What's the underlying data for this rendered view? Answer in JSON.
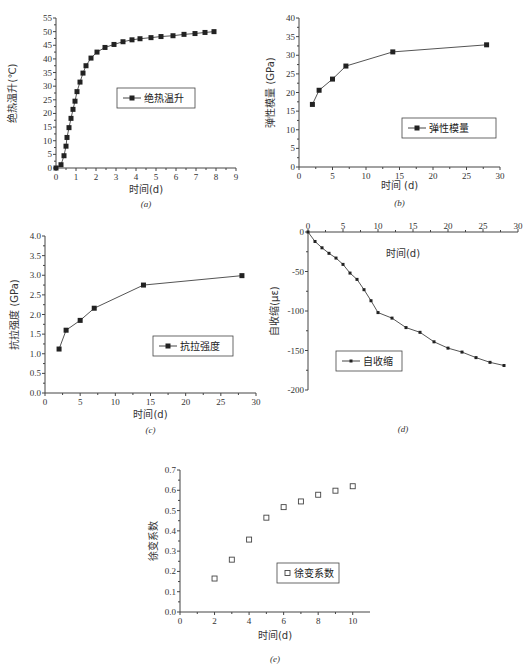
{
  "chart_data": [
    {
      "id": "a",
      "type": "line",
      "caption": "(a)",
      "xlabel": "时间(d)",
      "ylabel": "绝热温升(℃)",
      "xlim": [
        0,
        9
      ],
      "ylim": [
        0,
        55
      ],
      "xticks": [
        0,
        1,
        2,
        3,
        4,
        5,
        6,
        7,
        8,
        9
      ],
      "yticks": [
        0,
        5,
        10,
        15,
        20,
        25,
        30,
        35,
        40,
        45,
        50,
        55
      ],
      "legend": "绝热温升",
      "marker": "filled-square",
      "x": [
        0,
        0.25,
        0.4,
        0.5,
        0.55,
        0.65,
        0.75,
        0.85,
        0.95,
        1.05,
        1.2,
        1.35,
        1.5,
        1.75,
        2.05,
        2.45,
        2.9,
        3.35,
        3.8,
        4.2,
        4.75,
        5.25,
        5.85,
        6.4,
        6.95,
        7.45,
        7.9
      ],
      "values": [
        0,
        1.2,
        4.5,
        8,
        11.2,
        14.8,
        18.2,
        21.5,
        24.5,
        28,
        31.5,
        34.8,
        37.5,
        40.3,
        42.5,
        44.2,
        45.3,
        46.3,
        47,
        47.4,
        47.8,
        48.2,
        48.5,
        49,
        49.3,
        49.7,
        50
      ]
    },
    {
      "id": "b",
      "type": "line",
      "caption": "(b)",
      "xlabel": "时间 (d)",
      "ylabel": "弹性模量 (GPa)",
      "xlim": [
        0,
        30
      ],
      "ylim": [
        0,
        40
      ],
      "xticks": [
        0,
        5,
        10,
        15,
        20,
        25,
        30
      ],
      "yticks": [
        0,
        5,
        10,
        15,
        20,
        25,
        30,
        35,
        40
      ],
      "legend": "弹性模量",
      "marker": "filled-square",
      "x": [
        2,
        3,
        5,
        7,
        14,
        28
      ],
      "values": [
        16.8,
        20.6,
        23.6,
        27.1,
        30.9,
        32.8
      ]
    },
    {
      "id": "c",
      "type": "line",
      "caption": "(c)",
      "xlabel": "时间(d)",
      "ylabel": "抗拉强度 (GPa)",
      "xlim": [
        0,
        30
      ],
      "ylim": [
        0,
        4.0
      ],
      "xticks": [
        0,
        5,
        10,
        15,
        20,
        25,
        30
      ],
      "yticks": [
        "0.0",
        "0.5",
        "1.0",
        "1.5",
        "2.0",
        "2.5",
        "3.0",
        "3.5",
        "4.0"
      ],
      "legend": "抗拉强度",
      "marker": "filled-square",
      "x": [
        2,
        3,
        5,
        7,
        14,
        28
      ],
      "values": [
        1.12,
        1.6,
        1.85,
        2.16,
        2.75,
        2.99
      ]
    },
    {
      "id": "d",
      "type": "line",
      "caption": "(d)",
      "xlabel": "时间(d)",
      "ylabel": "自收缩(με)",
      "xlim": [
        0,
        30
      ],
      "ylim": [
        -200,
        0
      ],
      "xticks": [
        0,
        5,
        10,
        15,
        20,
        25,
        30
      ],
      "yticks": [
        0,
        -50,
        -100,
        -150,
        -200
      ],
      "legend": "自收缩",
      "marker": "filled-square-small",
      "x": [
        0,
        1,
        2,
        3,
        4,
        5,
        6,
        7,
        8,
        9,
        10,
        12,
        14,
        16,
        18,
        20,
        22,
        24,
        26,
        28
      ],
      "values": [
        0,
        -12,
        -20,
        -27,
        -33,
        -41,
        -52,
        -60,
        -73,
        -87,
        -102,
        -109,
        -121,
        -127,
        -139,
        -147,
        -152,
        -159,
        -165,
        -169
      ]
    },
    {
      "id": "e",
      "type": "scatter",
      "caption": "(e)",
      "xlabel": "时间(d)",
      "ylabel": "徐变系数",
      "xlim": [
        0,
        11
      ],
      "ylim": [
        0,
        0.7
      ],
      "xticks": [
        0,
        2,
        4,
        6,
        8,
        10
      ],
      "yticks": [
        "0.0",
        "0.1",
        "0.2",
        "0.3",
        "0.4",
        "0.5",
        "0.6",
        "0.7"
      ],
      "legend": "徐变系数",
      "marker": "open-square",
      "x": [
        2,
        3,
        4,
        5,
        6,
        7,
        8,
        9,
        10
      ],
      "values": [
        0.165,
        0.258,
        0.357,
        0.465,
        0.517,
        0.545,
        0.578,
        0.598,
        0.62
      ]
    }
  ],
  "layout": {
    "a": {
      "x0": 56,
      "x1": 236,
      "y0": 168,
      "y1": 18,
      "legend": [
        117,
        88,
        78,
        20
      ],
      "caption_y": 207,
      "xlabel_y": 193,
      "ylabel_x": 16
    },
    "b": {
      "x0": 299,
      "x1": 500,
      "y0": 167,
      "y1": 18,
      "legend": [
        402,
        118,
        94,
        20
      ],
      "caption_y": 206,
      "xlabel_y": 189,
      "ylabel_x": 274
    },
    "c": {
      "x0": 45,
      "x1": 256,
      "y0": 393,
      "y1": 236,
      "legend": [
        153,
        336,
        80,
        20
      ],
      "caption_y": 433,
      "xlabel_y": 418,
      "ylabel_x": 18
    },
    "d": {
      "x0": 308,
      "x1": 518,
      "y0": 232,
      "y1": 390,
      "legend": [
        336,
        351,
        66,
        20
      ],
      "caption_y": 432,
      "xlabel_y": 257,
      "ylabel_x": 278
    },
    "e": {
      "x0": 180,
      "x1": 370,
      "y0": 612,
      "y1": 470,
      "legend": [
        277,
        563,
        62,
        20
      ],
      "caption_y": 662,
      "xlabel_y": 639,
      "ylabel_x": 157
    }
  }
}
